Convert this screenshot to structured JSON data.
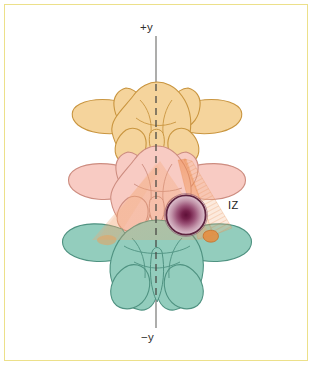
{
  "figure": {
    "width": 314,
    "height": 367,
    "background_color": "#ffffff",
    "border_color": "#ece08a"
  },
  "axis": {
    "positive_label": "+y",
    "negative_label": "−y",
    "line_color": "#8a8a88",
    "orientation": "vertical",
    "dashed_segment_color": "#4a4a46"
  },
  "annotations": [
    {
      "id": "iz",
      "label": "IZ",
      "description": "injection zone marker",
      "color": "#232321"
    }
  ],
  "anatomy": {
    "vertebrae": [
      {
        "id": "superior-vertebra",
        "level_label": "superior",
        "fill_color": "#f5d49c",
        "stroke_color": "#c9953f"
      },
      {
        "id": "middle-vertebra",
        "level_label": "middle",
        "fill_color": "#f8cbc3",
        "stroke_color": "#cd8d80"
      },
      {
        "id": "inferior-vertebra",
        "level_label": "inferior",
        "fill_color": "#93cdbd",
        "stroke_color": "#4f9281"
      }
    ],
    "target_lesion": {
      "id": "target-lesion",
      "center_color": "#6d1840",
      "mid_color": "#a55a7f",
      "ring_color": "#5e2440",
      "description": "radial gradient target sphere"
    },
    "beam": {
      "id": "injection-beam",
      "fill_color": "#f2a06a",
      "description": "translucent orange trajectory cone converging on target"
    }
  }
}
